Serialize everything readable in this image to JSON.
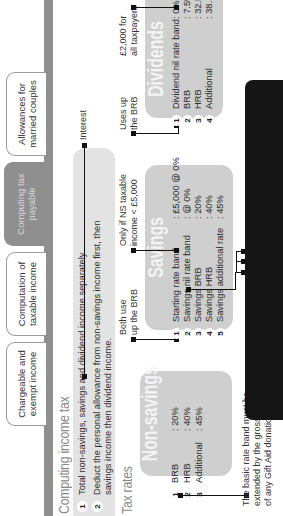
{
  "tabs": [
    {
      "label_line1": "Chargeable and",
      "label_line2": "exempt income",
      "active": false
    },
    {
      "label_line1": "Computation of",
      "label_line2": "taxable income",
      "active": false
    },
    {
      "label_line1": "Computing tax",
      "label_line2": "payable",
      "active": true
    },
    {
      "label_line1": "Allowances for",
      "label_line2": "married couples",
      "active": false
    }
  ],
  "section_title": "Computing income tax",
  "steps": [
    {
      "num": "1",
      "line1": "Total non-savings, savings and dividend income separately.",
      "line2": ""
    },
    {
      "num": "2",
      "line1": "Deduct the personal allowance from non-savings income first, then",
      "line2": "savings income then dividend income."
    }
  ],
  "interest_label": "Interest",
  "tax_rates_title": "Tax rates",
  "non_savings": {
    "title": "Non-savings",
    "rows": [
      {
        "num": "1",
        "label": "BRB",
        "value": ": 20%"
      },
      {
        "num": "2",
        "label": "HRB",
        "value": ": 40%"
      },
      {
        "num": "3",
        "label": "Additional",
        "value": ": 45%"
      }
    ]
  },
  "savings": {
    "title": "Savings",
    "rows": [
      {
        "num": "1",
        "label": "Starting rate band",
        "value": ": £5,000 @ 0%"
      },
      {
        "num": "2",
        "label": "Savings nil rate band",
        "value": ": @ 0%"
      },
      {
        "num": "3",
        "label": "Savings BRB",
        "value": ": 20%"
      },
      {
        "num": "4",
        "label": "Savings HRB",
        "value": ": 40%"
      },
      {
        "num": "5",
        "label": "Savings additional rate",
        "value": ": 45%"
      }
    ]
  },
  "dividends": {
    "title": "Dividends",
    "rows": [
      {
        "num": "1",
        "label": "Dividend nil rate band",
        "value": ": 0%"
      },
      {
        "num": "2",
        "label": "BRB",
        "value": ": 7.5%"
      },
      {
        "num": "3",
        "label": "HRB",
        "value": ": 32.5%"
      },
      {
        "num": "4",
        "label": "Additional",
        "value": ": 38.1%"
      }
    ]
  },
  "notes": {
    "both_use_brb": [
      "Both use",
      "up the BRB"
    ],
    "only_if_ns": [
      "Only if NS taxable",
      "income < £5,000"
    ],
    "uses_up_brb": [
      "Uses up",
      "the BRB"
    ],
    "dividend_allowance": [
      "£2,000 for",
      "all taxpayers"
    ],
    "savings_allowance": [
      "£1,000 – BR",
      "£500 – HR",
      "£0 – AR"
    ],
    "gift_aid": [
      "The basic rate band must be",
      "extended by the gross amount",
      "of any Gift Aid donation."
    ]
  }
}
